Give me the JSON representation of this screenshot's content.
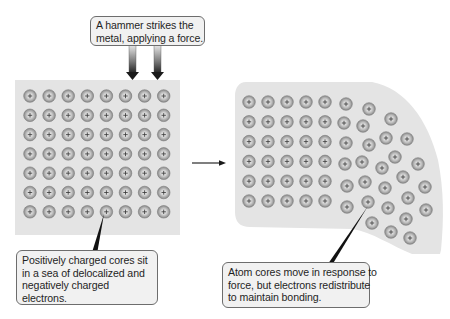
{
  "diagram": {
    "type": "metallic-bonding-malleability",
    "colors": {
      "panel_fill": "#e4e4e4",
      "ion_fill_outer": "#8f8f8f",
      "ion_fill_inner": "#d9d9d9",
      "ion_stroke": "#7a7a7a",
      "plus_color": "#333333",
      "arrow_dark": "#1a1a1a",
      "callout_fill": "#f1f1f1",
      "callout_border": "#6d6d6d",
      "pointer_color": "#111111"
    },
    "ion_symbol": "+",
    "ion_radius": 6.3
  },
  "callouts": {
    "top": {
      "lines": [
        "A hammer strikes the",
        "metal, applying a force."
      ]
    },
    "left": {
      "lines": [
        "Positively charged cores sit",
        "in a sea of delocalized and",
        "negatively charged",
        "electrons."
      ]
    },
    "right": {
      "lines": [
        "Atom cores move in response to",
        "force, but electrons redistribute",
        "to maintain bonding."
      ]
    }
  },
  "left_panel": {
    "label": "before-hammer-strike",
    "rows": 7,
    "cols": 8,
    "origin_x": 30,
    "origin_y": 96,
    "spacing_x": 19.1,
    "spacing_y": 19.3
  },
  "right_panel": {
    "label": "after-hammer-strike",
    "grid": {
      "rows": 6,
      "cols": 5,
      "origin_x": 249,
      "origin_y": 102,
      "spacing_x": 19,
      "spacing_y": 19.8
    },
    "displaced_ions": [
      [
        346,
        104
      ],
      [
        369,
        109
      ],
      [
        344,
        123
      ],
      [
        363,
        126
      ],
      [
        391,
        119
      ],
      [
        346,
        143
      ],
      [
        369,
        145
      ],
      [
        386,
        138
      ],
      [
        407,
        139
      ],
      [
        345,
        164
      ],
      [
        362,
        162
      ],
      [
        382,
        168
      ],
      [
        395,
        157
      ],
      [
        418,
        164
      ],
      [
        347,
        186
      ],
      [
        365,
        182
      ],
      [
        385,
        188
      ],
      [
        403,
        177
      ],
      [
        425,
        187
      ],
      [
        347,
        207
      ],
      [
        368,
        202
      ],
      [
        388,
        208
      ],
      [
        408,
        198
      ],
      [
        426,
        210
      ],
      [
        372,
        223
      ],
      [
        406,
        219
      ],
      [
        391,
        232
      ],
      [
        410,
        238
      ]
    ]
  },
  "arrows": {
    "hammer_force": [
      {
        "x": 132.5,
        "y1": 45,
        "y2": 80
      },
      {
        "x": 157.5,
        "y1": 45,
        "y2": 80
      }
    ],
    "transition": {
      "x1": 192,
      "x2": 226,
      "y": 163
    }
  },
  "pointers": {
    "left": {
      "x1": 104,
      "y1": 214,
      "x2": 95,
      "y2": 251,
      "w": 5
    },
    "right": {
      "x1": 368,
      "y1": 206,
      "x2": 331,
      "y2": 263,
      "w": 4
    }
  }
}
